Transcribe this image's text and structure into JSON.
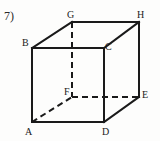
{
  "figure": {
    "problem_number": "7)",
    "shape": "cube",
    "stroke_color": "#1a1a1a",
    "background_color": "#fdfdfc",
    "solid_stroke_width": 2,
    "dashed_stroke_width": 2,
    "dash_pattern": "6 4",
    "vertices": [
      {
        "id": "A",
        "label": "A",
        "x": 32,
        "y": 122,
        "hidden": false,
        "position": "front-bottom-left"
      },
      {
        "id": "B",
        "label": "B",
        "x": 32,
        "y": 48,
        "hidden": false,
        "position": "front-top-left"
      },
      {
        "id": "C",
        "label": "C",
        "x": 104,
        "y": 48,
        "hidden": false,
        "position": "front-top-right"
      },
      {
        "id": "D",
        "label": "D",
        "x": 104,
        "y": 122,
        "hidden": false,
        "position": "front-bottom-right"
      },
      {
        "id": "E",
        "label": "E",
        "x": 139,
        "y": 97,
        "hidden": false,
        "position": "back-bottom-right"
      },
      {
        "id": "F",
        "label": "F",
        "x": 72,
        "y": 97,
        "hidden": true,
        "position": "back-bottom-left"
      },
      {
        "id": "G",
        "label": "G",
        "x": 72,
        "y": 22,
        "hidden": false,
        "position": "back-top-left"
      },
      {
        "id": "H",
        "label": "H",
        "x": 139,
        "y": 22,
        "hidden": false,
        "position": "back-top-right"
      }
    ],
    "solid_edges": [
      {
        "from": "B",
        "to": "C",
        "x1": 32,
        "y1": 48,
        "x2": 104,
        "y2": 48
      },
      {
        "from": "B",
        "to": "A",
        "x1": 32,
        "y1": 48,
        "x2": 32,
        "y2": 122
      },
      {
        "from": "A",
        "to": "D",
        "x1": 32,
        "y1": 122,
        "x2": 104,
        "y2": 122
      },
      {
        "from": "D",
        "to": "C",
        "x1": 104,
        "y1": 122,
        "x2": 104,
        "y2": 48
      },
      {
        "from": "B",
        "to": "G",
        "x1": 32,
        "y1": 48,
        "x2": 72,
        "y2": 22
      },
      {
        "from": "G",
        "to": "H",
        "x1": 72,
        "y1": 22,
        "x2": 139,
        "y2": 22
      },
      {
        "from": "C",
        "to": "H",
        "x1": 104,
        "y1": 48,
        "x2": 139,
        "y2": 22
      },
      {
        "from": "H",
        "to": "E",
        "x1": 139,
        "y1": 22,
        "x2": 139,
        "y2": 97
      },
      {
        "from": "D",
        "to": "E",
        "x1": 104,
        "y1": 122,
        "x2": 139,
        "y2": 97
      }
    ],
    "dashed_edges": [
      {
        "from": "G",
        "to": "F",
        "x1": 72,
        "y1": 22,
        "x2": 72,
        "y2": 97
      },
      {
        "from": "F",
        "to": "E",
        "x1": 72,
        "y1": 97,
        "x2": 139,
        "y2": 97
      },
      {
        "from": "A",
        "to": "F",
        "x1": 32,
        "y1": 122,
        "x2": 72,
        "y2": 97
      }
    ]
  }
}
